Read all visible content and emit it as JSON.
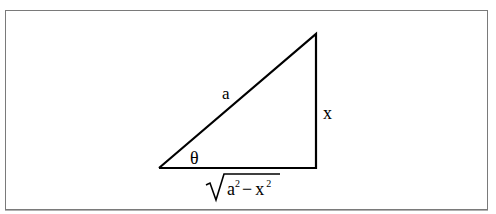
{
  "diagram": {
    "type": "right-triangle",
    "labels": {
      "hypotenuse": "a",
      "opposite": "x",
      "angle": "θ",
      "adjacent": {
        "base1": "a",
        "exp1": "2",
        "op": "−",
        "base2": "x",
        "exp2": "2"
      }
    },
    "vertices": {
      "angle_vertex": [
        159,
        168
      ],
      "right_angle_vertex": [
        316,
        168
      ],
      "top_vertex": [
        316,
        34
      ]
    },
    "colors": {
      "stroke": "#000000",
      "frame": "#7a7a7a",
      "background": "#ffffff"
    }
  }
}
